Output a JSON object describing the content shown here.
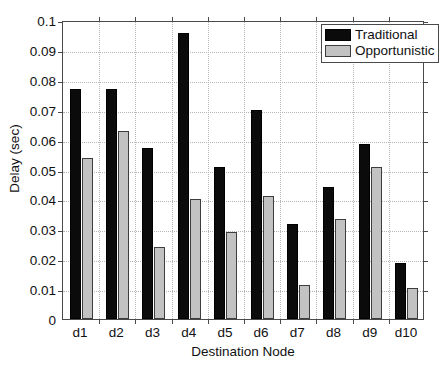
{
  "chart_data": {
    "type": "bar",
    "title": "",
    "xlabel": "Destination Node",
    "ylabel": "Delay (sec)",
    "categories": [
      "d1",
      "d2",
      "d3",
      "d4",
      "d5",
      "d6",
      "d7",
      "d8",
      "d9",
      "d10"
    ],
    "series": [
      {
        "name": "Traditional",
        "color": "#0b0b0b",
        "values": [
          0.0768,
          0.0768,
          0.0573,
          0.0958,
          0.051,
          0.07,
          0.0318,
          0.0443,
          0.0585,
          0.0188
        ]
      },
      {
        "name": "Opportunistic",
        "color": "#c2c2c2",
        "values": [
          0.054,
          0.063,
          0.024,
          0.04,
          0.029,
          0.041,
          0.0115,
          0.0333,
          0.0508,
          0.0105
        ]
      }
    ],
    "ylim": [
      0,
      0.1
    ],
    "yticks": [
      0,
      0.01,
      0.02,
      0.03,
      0.04,
      0.05,
      0.06,
      0.07,
      0.08,
      0.09,
      0.1
    ],
    "ytick_labels": [
      "0",
      "0.01",
      "0.02",
      "0.03",
      "0.04",
      "0.05",
      "0.06",
      "0.07",
      "0.08",
      "0.09",
      "0.1"
    ],
    "grid": true,
    "legend_position": "top-right"
  },
  "legend": {
    "items": [
      {
        "label": "Traditional"
      },
      {
        "label": "Opportunistic"
      }
    ]
  },
  "axes": {
    "x_title": "Destination Node",
    "y_title": "Delay (sec)"
  }
}
